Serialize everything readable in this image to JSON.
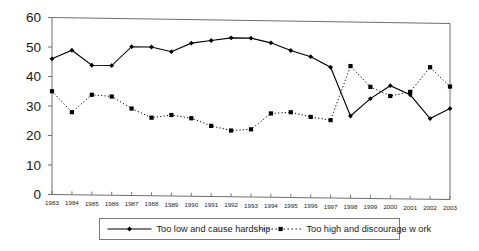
{
  "chart_data": {
    "type": "line",
    "title": "",
    "xlabel": "",
    "ylabel": "",
    "ylim": [
      0,
      60
    ],
    "yticks": [
      0,
      10,
      20,
      30,
      40,
      50,
      60
    ],
    "grid": false,
    "legend_position": "bottom",
    "categories": [
      "1983",
      "1984",
      "1985",
      "1986",
      "1987",
      "1988",
      "1989",
      "1990",
      "1991",
      "1992",
      "1993",
      "1994",
      "1995",
      "1996",
      "1997",
      "1998",
      "1999",
      "2000",
      "2001",
      "2002",
      "2003"
    ],
    "series": [
      {
        "name": "Too low  and cause hardship",
        "style": "solid",
        "marker": "diamond",
        "color": "#000000",
        "values": [
          46,
          49,
          44,
          44,
          50.5,
          50.5,
          49,
          52,
          53,
          54,
          54,
          52.5,
          50,
          48,
          44.5,
          28,
          34,
          38.5,
          35.5,
          27.5,
          31
        ]
      },
      {
        "name": "Too high and discourage w ork",
        "style": "dotted",
        "marker": "square",
        "color": "#000000",
        "values": [
          35,
          28,
          34,
          33.5,
          29.5,
          26.5,
          27.5,
          26.5,
          24,
          22.5,
          23,
          28.5,
          29,
          27.5,
          26.5,
          45,
          38,
          35,
          36.5,
          45,
          38.5
        ]
      }
    ]
  },
  "legend": {
    "entries": [
      {
        "label": "Too low  and cause hardship"
      },
      {
        "label": "Too high and discourage w ork"
      }
    ]
  }
}
